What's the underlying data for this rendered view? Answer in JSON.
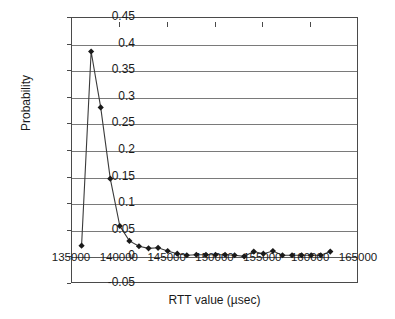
{
  "chart_data": {
    "type": "line",
    "title": "",
    "xlabel": "RTT value (µsec)",
    "ylabel": "Probability",
    "xlim": [
      135000,
      165000
    ],
    "ylim": [
      -0.05,
      0.45
    ],
    "xticks": [
      135000,
      140000,
      145000,
      150000,
      155000,
      160000,
      165000
    ],
    "xtick_labels": [
      "135000",
      "140000",
      "145000",
      "150000",
      "155000",
      "160000",
      "165000"
    ],
    "yticks": [
      -0.05,
      0,
      0.05,
      0.1,
      0.15,
      0.2,
      0.25,
      0.3,
      0.35,
      0.4,
      0.45
    ],
    "ytick_labels": [
      "-0.05",
      "0",
      "0.05",
      "0.1",
      "0.15",
      "0.2",
      "0.25",
      "0.3",
      "0.35",
      "0.4",
      "0.45"
    ],
    "grid": "horizontal",
    "legend": "none",
    "marker": "diamond",
    "marker_color": "#1a1a1a",
    "line_color": "#3a3a3a",
    "series": [
      {
        "name": "Probability",
        "x": [
          136000,
          137000,
          138000,
          139000,
          140000,
          141000,
          142000,
          143000,
          144000,
          145000,
          146000,
          147000,
          148000,
          149000,
          150000,
          151000,
          152000,
          153000,
          154000,
          155000,
          156000,
          157000,
          158000,
          159000,
          160000,
          161000,
          162000
        ],
        "y": [
          0.022,
          0.387,
          0.282,
          0.148,
          0.059,
          0.031,
          0.021,
          0.017,
          0.018,
          0.012,
          0.007,
          0.004,
          0.005,
          0.005,
          0.005,
          0.005,
          0.004,
          0.002,
          0.011,
          0.007,
          0.012,
          0.004,
          0.004,
          0.004,
          0.004,
          0.004,
          0.011
        ]
      }
    ]
  }
}
